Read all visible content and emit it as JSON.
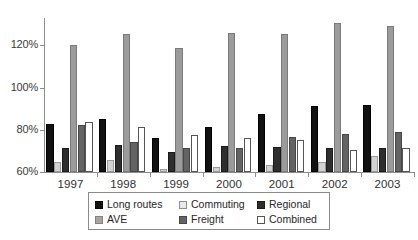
{
  "chart_data": {
    "type": "bar",
    "title": "",
    "subtitle": "",
    "xlabel": "",
    "ylabel": "",
    "grid": false,
    "legend_position": "bottom",
    "categories": [
      "1997",
      "1998",
      "1999",
      "2000",
      "2001",
      "2002",
      "2003"
    ],
    "ylim": [
      60,
      133
    ],
    "yticks": [
      60,
      80,
      100,
      120
    ],
    "ytick_labels": [
      "60%",
      "80%",
      "100%",
      "120%"
    ],
    "series": [
      {
        "name": "Long routes",
        "color": "#111111",
        "values": [
          82.6,
          85.2,
          76.3,
          81.1,
          87.4,
          91.2,
          91.6
        ]
      },
      {
        "name": "Commuting",
        "color": "#d2d2d2",
        "values": [
          64.6,
          65.8,
          61.2,
          62.5,
          63.1,
          64.9,
          67.4
        ]
      },
      {
        "name": "Regional",
        "color": "#2e2e2e",
        "values": [
          71.2,
          72.6,
          69.3,
          72.1,
          71.7,
          71.4,
          71.6
        ]
      },
      {
        "name": "AVE",
        "color": "#9b9b9b",
        "values": [
          120.4,
          125.2,
          118.6,
          125.8,
          125.6,
          130.6,
          129.2
        ]
      },
      {
        "name": "Freight",
        "color": "#636363",
        "values": [
          82.3,
          74.3,
          71.2,
          71.6,
          76.6,
          77.8,
          78.9
        ]
      },
      {
        "name": "Combined",
        "color": "#ffffff",
        "values": [
          83.9,
          81.2,
          77.4,
          76.2,
          75.1,
          70.3,
          71.6
        ]
      }
    ]
  },
  "legend": {
    "items": [
      {
        "label": "Long routes",
        "series_index": 0
      },
      {
        "label": "Commuting",
        "series_index": 1
      },
      {
        "label": "Regional",
        "series_index": 2
      },
      {
        "label": "AVE",
        "series_index": 3
      },
      {
        "label": "Freight",
        "series_index": 4
      },
      {
        "label": "Combined",
        "series_index": 5
      }
    ],
    "order": [
      0,
      1,
      2,
      3,
      4,
      5
    ]
  },
  "axis": {
    "y_tick_labels": [
      "120%",
      "100%",
      "80%",
      "60%"
    ]
  }
}
